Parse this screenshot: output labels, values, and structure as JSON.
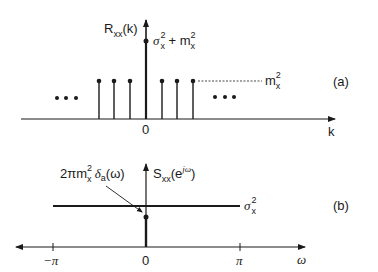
{
  "panel_a": {
    "y_label_main": "R",
    "y_label_sub": "xx",
    "y_label_arg": "(k)",
    "peak_label_sigma": "σ",
    "peak_label_sup": "2",
    "peak_label_sub": "x",
    "peak_label_plus": " + m",
    "peak_label_sup2": "2",
    "peak_label_sub2": "x",
    "level_label_main": "m",
    "level_label_sup": "2",
    "level_label_sub": "x",
    "origin_label": "0",
    "x_label": "k",
    "ellipsis_left": "• • •",
    "ellipsis_right": "• • •",
    "tag": "(a)"
  },
  "panel_b": {
    "y_label_main": "S",
    "y_label_sub": "xx",
    "y_label_arg": "(e",
    "y_label_exp": "jω",
    "y_label_close": ")",
    "impulse_label_pre": "2πm",
    "impulse_label_sup": "2",
    "impulse_label_sub": "x",
    "impulse_label_delta": " δ",
    "impulse_label_dsub": "a",
    "impulse_label_arg": "(ω)",
    "level_label_main": "σ",
    "level_label_sup": "2",
    "level_label_sub": "x",
    "tick_neg_pi": "−π",
    "origin_label": "0",
    "tick_pi": "π",
    "x_label": "ω",
    "tag": "(b)"
  },
  "colors": {
    "ink": "#1a1a1a",
    "background": "#ffffff"
  }
}
